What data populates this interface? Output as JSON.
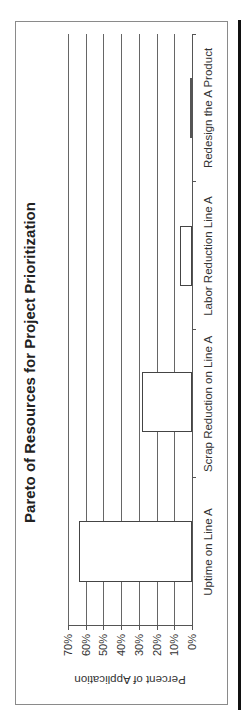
{
  "chart_data": {
    "type": "bar",
    "title": "Pareto of Resources for Project Prioritization",
    "xlabel": "",
    "ylabel": "Percent of Application",
    "categories": [
      "Uptime on Line A",
      "Scrap Reduction on Line A",
      "Labor Reduction Line A",
      "Redesign the A Product"
    ],
    "values": [
      64,
      28,
      7,
      1
    ],
    "value_format": "percent",
    "ylim": [
      0,
      70
    ],
    "yticks": [
      "0%",
      "10%",
      "20%",
      "30%",
      "40%",
      "50%",
      "60%",
      "70%"
    ],
    "grid": true,
    "orientation_note": "figure rotated 90 degrees counter-clockwise"
  },
  "ui": {
    "title": "Pareto of Resources for Project Prioritization",
    "ylabel": "Percent of Application",
    "yticks": [
      "0%",
      "10%",
      "20%",
      "30%",
      "40%",
      "50%",
      "60%",
      "70%"
    ],
    "categories": [
      "Uptime on Line A",
      "Scrap Reduction on Line A",
      "Labor Reduction Line A",
      "Redesign the A Product"
    ]
  }
}
